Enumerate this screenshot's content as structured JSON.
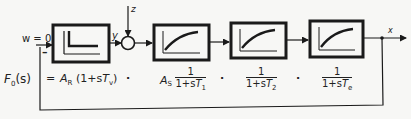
{
  "labels": {
    "setpoint": "w = 0",
    "feedback_sign": "–",
    "controller_output": "y",
    "disturbance": "z",
    "output": "x"
  },
  "blocks": [
    {
      "name": "controller",
      "icon": "pd-step-response-icon"
    },
    {
      "name": "plant-1",
      "icon": "first-order-lag-icon"
    },
    {
      "name": "plant-2",
      "icon": "first-order-lag-icon"
    },
    {
      "name": "plant-3",
      "icon": "first-order-lag-icon"
    }
  ],
  "formula": {
    "lhs": "F",
    "lhs_sub": "0",
    "lhs_arg": "(s)",
    "equals": "=",
    "term1_gain": "A",
    "term1_gain_sub": "R",
    "term1_body_pre": "(1+s",
    "term1_T": "T",
    "term1_T_sub": "v",
    "term1_body_post": ")",
    "dot": "·",
    "term2_gain": "A",
    "term2_gain_sub": "S",
    "term2_num": "1",
    "term2_den_pre": "1+s",
    "term2_T": "T",
    "term2_T_sub": "1",
    "term3_num": "1",
    "term3_den_pre": "1+s",
    "term3_T": "T",
    "term3_T_sub": "2",
    "term4_num": "1",
    "term4_den_pre": "1+s",
    "term4_T": "T",
    "term4_T_sub": "e"
  },
  "colors": {
    "ink": "#1a1a1a",
    "paper": "#f7f7f5"
  }
}
